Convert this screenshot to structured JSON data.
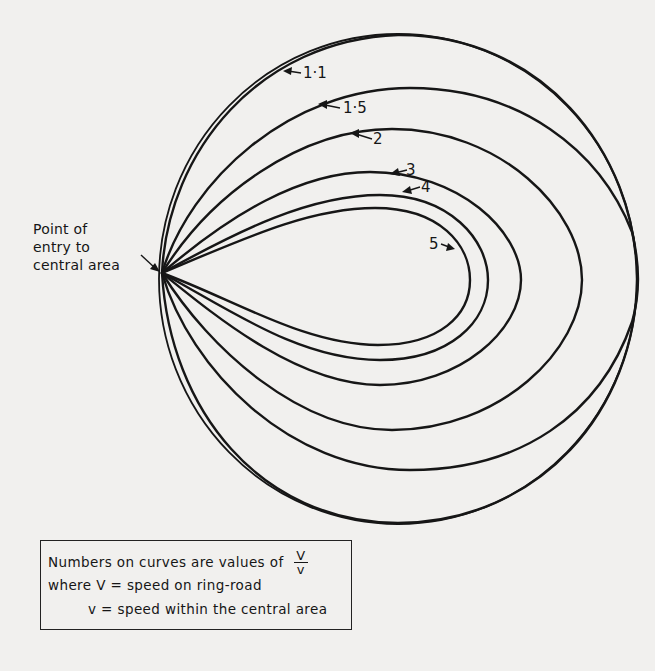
{
  "figure": {
    "entry_label_lines": [
      "Point of",
      "entry to",
      "central area"
    ],
    "entry_point": [
      162,
      273
    ],
    "outer_circle": {
      "name": "ring-road",
      "cx": 398,
      "cy": 279,
      "rx": 239,
      "ry": 245
    },
    "curves": [
      {
        "value": "1·1",
        "path": "M162,273 C168,150 260,40 398,35 C540,34 636,150 637,279 C636,410 540,522 398,523 C260,522 170,410 162,273",
        "label_pos": [
          303,
          78
        ],
        "lead": "M301,73 L288,71",
        "arrow": "M283,71 L292,67 L291,75 Z"
      },
      {
        "value": "1·5",
        "path": "M162,273 C190,180 290,88 410,88 C520,88 600,150 632,232 C640,265 640,295 632,322 C600,415 520,470 410,470 C290,470 190,370 162,273",
        "label_pos": [
          343,
          113
        ],
        "lead": "M340,108 L325,105",
        "arrow": "M318,104 L327,100 L327,109 Z"
      },
      {
        "value": "2",
        "path": "M162,273 C210,195 300,129 392,129 C500,129 582,210 582,280 C582,350 500,430 392,430 C300,430 210,350 162,273",
        "label_pos": [
          373,
          144
        ],
        "lead": "M372,139 L356,134",
        "arrow": "M350,133 L359,129 L359,138 Z"
      },
      {
        "value": "3",
        "path": "M162,273 C230,215 300,172 370,172 C460,172 521,232 521,280 C521,330 460,385 380,385 C300,385 220,320 162,273",
        "label_pos": [
          406,
          175
        ],
        "lead": "M407,170 L395,173",
        "arrow": "M390,174 L398,168 L400,176 Z"
      },
      {
        "value": "4",
        "path": "M162,273 C240,230 310,195 380,195 C450,195 488,240 488,280 C488,322 450,360 380,360 C300,360 230,310 162,273",
        "label_pos": [
          421,
          192
        ],
        "lead": "M420,187 L407,191",
        "arrow": "M402,192 L410,186 L412,194 Z"
      },
      {
        "value": "5",
        "path": "M162,273 C245,238 310,208 375,208 C440,208 470,245 470,280 C470,315 440,345 378,345 C305,345 235,300 162,273",
        "label_pos": [
          429,
          249
        ],
        "lead": "M441,244 L449,247",
        "arrow": "M455,249 L446,251 L448,243 Z"
      }
    ],
    "entry_arrow": {
      "lead": "M141,255 L155,268",
      "arrow": "M160,272 L150,269 L155,263 Z"
    }
  },
  "legend": {
    "line1": "Numbers on curves are values of",
    "fraction_numerator": "V",
    "fraction_denominator": "v",
    "line2": "where  V = speed on ring-road",
    "line3": "v = speed  within  the  central  area"
  }
}
